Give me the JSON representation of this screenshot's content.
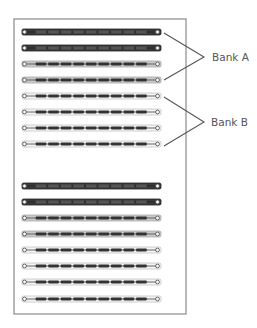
{
  "diagram": {
    "type": "memory-slot-layout",
    "board": {
      "x": 14,
      "y": 19,
      "width": 172,
      "height": 295,
      "stroke": "#8a8a8a"
    },
    "slot_geometry": {
      "x": 22,
      "width": 139,
      "height": 6,
      "pin_left_x": 24.5,
      "pin_right_x": 157.5,
      "dash_count": 9,
      "dash_start_x": 35,
      "dash_end_x": 148
    },
    "styles": {
      "dark": {
        "fill": "#3a3a3a",
        "stroke": "#222222",
        "dash": "#555555",
        "line": "#222222"
      },
      "medium": {
        "fill": "#c9c9c9",
        "stroke": "#a8a8a8",
        "dash": "#333333",
        "line": "#555555"
      },
      "light": {
        "fill": "#f4f4f4",
        "stroke": "#c4c4c4",
        "dash": "#333333",
        "line": "#555555"
      }
    },
    "slot_groups": [
      {
        "name": "upper-group",
        "slots": [
          {
            "y": 32,
            "style": "dark"
          },
          {
            "y": 48,
            "style": "dark"
          },
          {
            "y": 64,
            "style": "medium"
          },
          {
            "y": 80,
            "style": "medium"
          },
          {
            "y": 96,
            "style": "light"
          },
          {
            "y": 112,
            "style": "light"
          },
          {
            "y": 128,
            "style": "light"
          },
          {
            "y": 144,
            "style": "light"
          }
        ]
      },
      {
        "name": "lower-group",
        "slots": [
          {
            "y": 186,
            "style": "dark"
          },
          {
            "y": 202,
            "style": "dark"
          },
          {
            "y": 218,
            "style": "medium"
          },
          {
            "y": 234,
            "style": "medium"
          },
          {
            "y": 250,
            "style": "light"
          },
          {
            "y": 266,
            "style": "light"
          },
          {
            "y": 282,
            "style": "light"
          },
          {
            "y": 299,
            "style": "light"
          }
        ]
      }
    ],
    "callouts": [
      {
        "label": "Bank A",
        "apex": [
          204,
          57
        ],
        "from_top": [
          164,
          33
        ],
        "from_bottom": [
          164,
          80
        ],
        "text_x": 212,
        "text_y": 61
      },
      {
        "label": "Bank B",
        "apex": [
          204,
          122
        ],
        "from_top": [
          164,
          97
        ],
        "from_bottom": [
          164,
          146
        ],
        "text_x": 211,
        "text_y": 126
      }
    ],
    "line_color": "#555555"
  }
}
